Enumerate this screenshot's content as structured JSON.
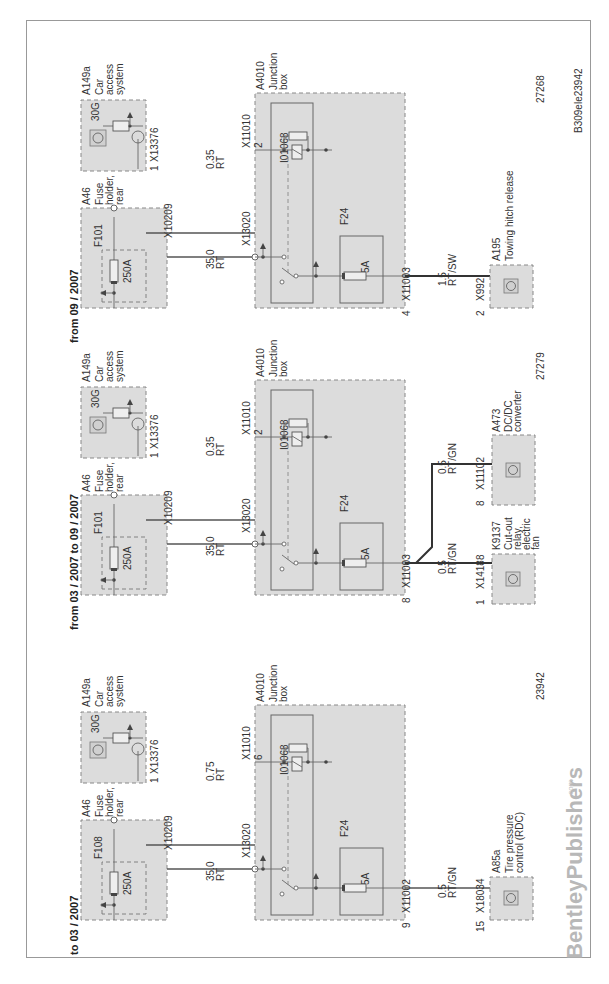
{
  "diagram": {
    "document_id": "B309ele23942",
    "watermark": {
      "brand": "BentleyPublishers",
      "suffix": ".com"
    },
    "sections": [
      {
        "title": "to 03 / 2007",
        "figure_number": "23942",
        "fuse_holder": {
          "id": "A46",
          "name_lines": [
            "Fuse",
            "holder,",
            "rear"
          ],
          "fuse_id": "F108",
          "fuse_rating": "250A",
          "connector": "X10209"
        },
        "car_access": {
          "id": "A149a",
          "name_lines": [
            "Car",
            "access",
            "system"
          ],
          "terminal": "30G",
          "connector": "X13376",
          "pin": "1"
        },
        "wire_main": {
          "size": "35.0",
          "color": "RT"
        },
        "wire_cas": {
          "size": "0.75",
          "color": "RT"
        },
        "junction_box": {
          "id": "A4010",
          "name_lines": [
            "Junction",
            "box"
          ],
          "relay_id": "I01068",
          "conn_main": "X13020",
          "conn_cas": "X11010",
          "pin_cas": "6",
          "fuse_id": "F24",
          "fuse_rating": "5A",
          "conn_out": "X11002",
          "pin_out": "9"
        },
        "outputs": [
          {
            "wire_size": "0.5",
            "wire_color": "RT/GN",
            "connector": "X18034",
            "pin": "15",
            "id": "A85a",
            "name_lines": [
              "Tire pressure",
              "control (RDC)"
            ]
          }
        ]
      },
      {
        "title": "from 03 / 2007 to 09 / 2007",
        "figure_number": "27279",
        "fuse_holder": {
          "id": "A46",
          "name_lines": [
            "Fuse",
            "holder,",
            "rear"
          ],
          "fuse_id": "F101",
          "fuse_rating": "250A",
          "connector": "X10209"
        },
        "car_access": {
          "id": "A149a",
          "name_lines": [
            "Car",
            "access",
            "system"
          ],
          "terminal": "30G",
          "connector": "X13376",
          "pin": "1"
        },
        "wire_main": {
          "size": "35.0",
          "color": "RT"
        },
        "wire_cas": {
          "size": "0.35",
          "color": "RT"
        },
        "junction_box": {
          "id": "A4010",
          "name_lines": [
            "Junction",
            "box"
          ],
          "relay_id": "I01068",
          "conn_main": "X13020",
          "conn_cas": "X11010",
          "pin_cas": "2",
          "fuse_id": "F24",
          "fuse_rating": "5A",
          "conn_out": "X11003",
          "pin_out": "8"
        },
        "outputs": [
          {
            "wire_size": "0.5",
            "wire_color": "RT/GN",
            "connector": "X14188",
            "pin": "1",
            "id": "K9137",
            "name_lines": [
              "Cut-out",
              "relay,",
              "electric",
              "fan"
            ]
          },
          {
            "wire_size": "0.5",
            "wire_color": "RT/GN",
            "connector": "X11102",
            "pin": "8",
            "id": "A473",
            "name_lines": [
              "DC/DC",
              "converter"
            ]
          }
        ]
      },
      {
        "title": "from 09 / 2007",
        "figure_number": "27268",
        "fuse_holder": {
          "id": "A46",
          "name_lines": [
            "Fuse",
            "holder,",
            "rear"
          ],
          "fuse_id": "F101",
          "fuse_rating": "250A",
          "connector": "X10209"
        },
        "car_access": {
          "id": "A149a",
          "name_lines": [
            "Car",
            "access",
            "system"
          ],
          "terminal": "30G",
          "connector": "X13376",
          "pin": "1"
        },
        "wire_main": {
          "size": "35.0",
          "color": "RT"
        },
        "wire_cas": {
          "size": "0.35",
          "color": "RT"
        },
        "junction_box": {
          "id": "A4010",
          "name_lines": [
            "Junction",
            "box"
          ],
          "relay_id": "I01068",
          "conn_main": "X13020",
          "conn_cas": "X11010",
          "pin_cas": "2",
          "fuse_id": "F24",
          "fuse_rating": "5A",
          "conn_out": "X11003",
          "pin_out": "4"
        },
        "outputs": [
          {
            "wire_size": "1.5",
            "wire_color": "RT/SW",
            "connector": "X992",
            "pin": "2",
            "id": "A195",
            "name_lines": [
              "Towing hitch release"
            ]
          }
        ]
      }
    ]
  }
}
